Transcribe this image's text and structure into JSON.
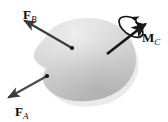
{
  "figure": {
    "background_color": "#ffffff",
    "body": {
      "name": "rigid-body-blob",
      "fill_light": "#e2e2e2",
      "fill_mid": "#cfcfcf",
      "fill_dark": "#b9b9b9",
      "shadow_color": "#d4d4d4"
    },
    "stroke_color": "#1a1a1a",
    "labels": {
      "force_b": {
        "symbol": "F",
        "subscript": "B"
      },
      "force_a": {
        "symbol": "F",
        "subscript": "A"
      },
      "moment_c": {
        "symbol": "M",
        "subscript": "C"
      }
    },
    "vectors": [
      {
        "id": "force-b-vector",
        "label": "F_B",
        "type": "force",
        "tail_x": 72,
        "tail_y": 48,
        "tip_x": 22,
        "tip_y": 19,
        "has_application_dot": true
      },
      {
        "id": "force-a-vector",
        "label": "F_A",
        "type": "force",
        "tail_x": 47,
        "tail_y": 76,
        "tip_x": 6,
        "tip_y": 99,
        "has_application_dot": true
      },
      {
        "id": "moment-c-vector",
        "label": "M_C",
        "type": "couple-moment",
        "tail_x": 107,
        "tail_y": 54,
        "tip_x": 148,
        "tip_y": 22,
        "has_application_dot": false,
        "has_curl": true
      }
    ]
  }
}
